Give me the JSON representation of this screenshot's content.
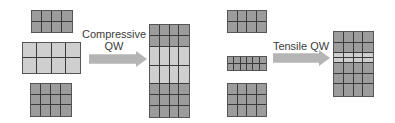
{
  "colors": {
    "barrier": "#9c9c9c",
    "well": "#cfcfcf",
    "gridline": "#3a3a3a",
    "arrow": "#b5b5b5",
    "text": "#3c3c3c"
  },
  "panels": [
    {
      "name": "compressive",
      "label_line1": "Compressive",
      "label_line2": "QW",
      "inputs": [
        {
          "role": "top-barrier",
          "cols": 4,
          "rows": 2,
          "shade": "dark",
          "x": 31,
          "y": 10,
          "w": 42,
          "h": 23
        },
        {
          "role": "well-layer",
          "cols": 4,
          "rows": 2,
          "shade": "light",
          "x": 22,
          "y": 42,
          "w": 59,
          "h": 32
        },
        {
          "role": "bottom-barrier",
          "cols": 4,
          "rows": 3,
          "shade": "dark",
          "x": 30,
          "y": 83,
          "w": 42,
          "h": 34
        }
      ],
      "result": {
        "x": 149,
        "y": 24,
        "w": 41,
        "h": 94,
        "cols": 4,
        "rows": [
          {
            "h": 11,
            "shade": "dark"
          },
          {
            "h": 11,
            "shade": "dark"
          },
          {
            "h": 19,
            "shade": "light"
          },
          {
            "h": 19,
            "shade": "light"
          },
          {
            "h": 11,
            "shade": "dark"
          },
          {
            "h": 11,
            "shade": "dark"
          },
          {
            "h": 11,
            "shade": "dark"
          }
        ]
      },
      "arrow": {
        "x": 89,
        "y": 51,
        "w": 58,
        "h": 16
      },
      "label_pos": {
        "x": 82,
        "y": 28,
        "w": 64
      }
    },
    {
      "name": "tensile",
      "label_line1": "Tensile QW",
      "label_line2": "",
      "inputs": [
        {
          "role": "top-barrier",
          "cols": 4,
          "rows": 2,
          "shade": "dark",
          "x": 227,
          "y": 10,
          "w": 40,
          "h": 23
        },
        {
          "role": "well-layer",
          "cols": 6,
          "rows": 2,
          "shade": "dark",
          "x": 227,
          "y": 56,
          "w": 40,
          "h": 15
        },
        {
          "role": "bottom-barrier",
          "cols": 4,
          "rows": 3,
          "shade": "dark",
          "x": 227,
          "y": 83,
          "w": 40,
          "h": 34
        }
      ],
      "result": {
        "x": 333,
        "y": 31,
        "w": 41,
        "h": 66,
        "cols": 4,
        "rows": [
          {
            "h": 11,
            "shade": "dark"
          },
          {
            "h": 11,
            "shade": "dark"
          },
          {
            "h": 5,
            "shade": "light"
          },
          {
            "h": 5,
            "shade": "light"
          },
          {
            "h": 11,
            "shade": "dark"
          },
          {
            "h": 11,
            "shade": "dark"
          },
          {
            "h": 12,
            "shade": "dark"
          }
        ]
      },
      "arrow": {
        "x": 273,
        "y": 50,
        "w": 57,
        "h": 16
      },
      "label_pos": {
        "x": 270,
        "y": 40,
        "w": 62
      }
    }
  ]
}
